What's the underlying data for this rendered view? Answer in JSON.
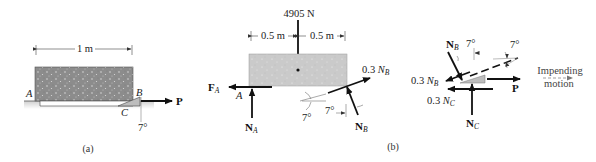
{
  "figure_a": {
    "caption": "(a)",
    "dimension_label": "1 m",
    "point_A": "A",
    "point_B": "B",
    "point_C": "C",
    "force_P": "P",
    "angle": "7°"
  },
  "figure_b": {
    "caption": "(b)",
    "weight_label": "4905 N",
    "dim_left": "0.5 m",
    "dim_right": "0.5 m",
    "point_A": "A",
    "force_FA": "F",
    "force_FA_sub": "A",
    "force_NA": "N",
    "force_NA_sub": "A",
    "friction_B": "0.3 ",
    "friction_B_var": "N",
    "friction_B_sub": "B",
    "force_NB": "N",
    "force_NB_sub": "B",
    "angle_left": "7°",
    "angle_right": "7°"
  },
  "wedge_fbd": {
    "force_NB": "N",
    "force_NB_sub": "B",
    "angle_1": "7°",
    "angle_2": "7°",
    "friction_B": "0.3 ",
    "friction_B_var": "N",
    "friction_B_sub": "B",
    "friction_C": "0.3 ",
    "friction_C_var": "N",
    "friction_C_sub": "C",
    "force_P": "P",
    "force_NC": "N",
    "force_NC_sub": "C",
    "motion_line1": "Impending",
    "motion_line2": "motion"
  },
  "colors": {
    "block_dark": "#8a8a8a",
    "block_light": "#c8c8c8",
    "wedge": "#b8b8b8",
    "arrow": "#111111",
    "ground": "#d0d0d0"
  }
}
